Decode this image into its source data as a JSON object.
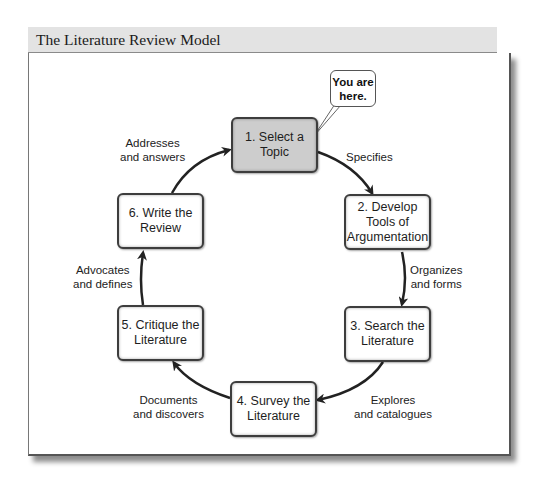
{
  "header": {
    "title": "The Literature Review Model"
  },
  "callout": {
    "text": "You are here.",
    "line1": "You are",
    "line2": "here."
  },
  "steps": [
    {
      "number": 1,
      "line1": "1. Select a",
      "line2": "Topic",
      "line3": "",
      "active": true
    },
    {
      "number": 2,
      "line1": "2. Develop",
      "line2": "Tools of",
      "line3": "Argumentation",
      "active": false
    },
    {
      "number": 3,
      "line1": "3. Search the",
      "line2": "Literature",
      "line3": "",
      "active": false
    },
    {
      "number": 4,
      "line1": "4. Survey the",
      "line2": "Literature",
      "line3": "",
      "active": false
    },
    {
      "number": 5,
      "line1": "5. Critique the",
      "line2": "Literature",
      "line3": "",
      "active": false
    },
    {
      "number": 6,
      "line1": "6. Write the",
      "line2": "Review",
      "line3": "",
      "active": false
    }
  ],
  "edges": [
    {
      "from": 1,
      "to": 2,
      "line1": "Specifies",
      "line2": ""
    },
    {
      "from": 2,
      "to": 3,
      "line1": "Organizes",
      "line2": "and forms"
    },
    {
      "from": 3,
      "to": 4,
      "line1": "Explores",
      "line2": "and catalogues"
    },
    {
      "from": 4,
      "to": 5,
      "line1": "Documents",
      "line2": "and discovers"
    },
    {
      "from": 5,
      "to": 6,
      "line1": "Advocates",
      "line2": "and defines"
    },
    {
      "from": 6,
      "to": 1,
      "line1": "Addresses",
      "line2": "and answers"
    }
  ],
  "colors": {
    "active_fill": "#cdcdcd",
    "box_border": "#3d3d3d",
    "header_bg": "#e3e3e3",
    "arrow": "#222222"
  }
}
